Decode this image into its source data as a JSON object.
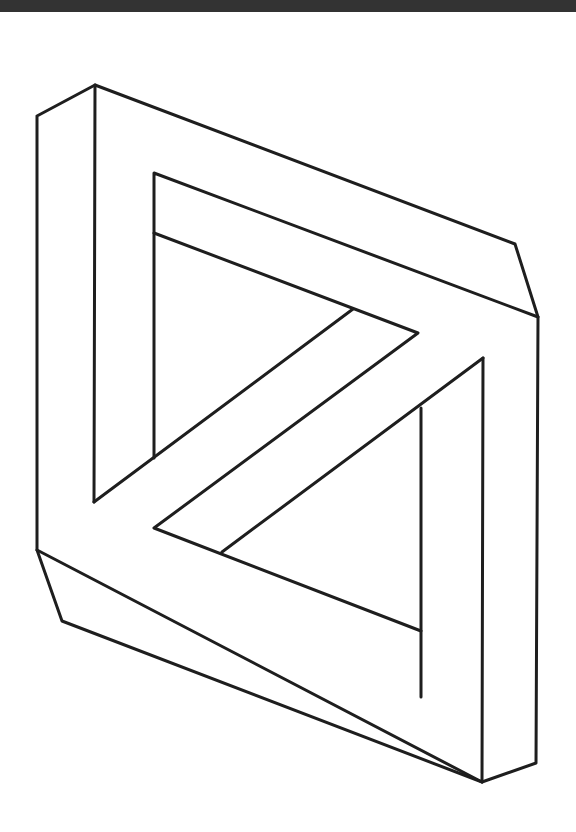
{
  "figure": {
    "stroke_color": "#1e1e1e",
    "background": "#ffffff",
    "top_band_color": "#333333"
  }
}
